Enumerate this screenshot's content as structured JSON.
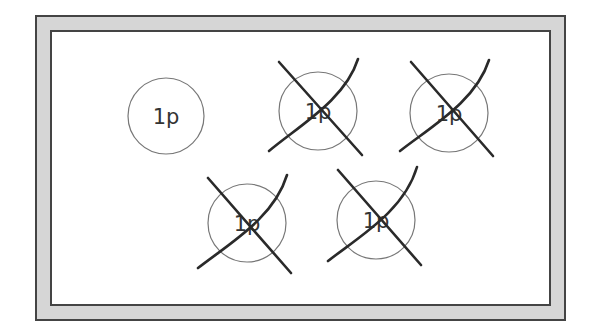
{
  "diagram": {
    "frame": {
      "outer": {
        "x": 36,
        "y": 16,
        "w": 529,
        "h": 304
      },
      "inner": {
        "x": 51,
        "y": 31,
        "w": 499,
        "h": 274
      },
      "fill_color": "#d6d6d6",
      "stroke_color": "#444444"
    },
    "coins": [
      {
        "id": "coin-1",
        "label": "1p",
        "cx": 166,
        "cy": 116,
        "r": 38,
        "crossed": false
      },
      {
        "id": "coin-2",
        "label": "1p",
        "cx": 318,
        "cy": 111,
        "r": 39,
        "crossed": true
      },
      {
        "id": "coin-3",
        "label": "1p",
        "cx": 449,
        "cy": 113,
        "r": 39,
        "crossed": true
      },
      {
        "id": "coin-4",
        "label": "1p",
        "cx": 247,
        "cy": 223,
        "r": 39,
        "crossed": true
      },
      {
        "id": "coin-5",
        "label": "1p",
        "cx": 376,
        "cy": 220,
        "r": 39,
        "crossed": true
      }
    ],
    "colors": {
      "coin_outline": "#777777",
      "label": "#333333",
      "cross": "#2a2a2a"
    }
  }
}
